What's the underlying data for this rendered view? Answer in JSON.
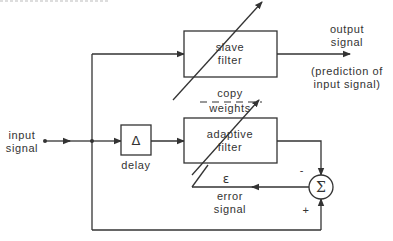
{
  "diagram": {
    "type": "adaptive-prediction-block-diagram",
    "blocks": {
      "slave_filter": {
        "line1": "slave",
        "line2": "filter"
      },
      "adaptive_filter": {
        "line1": "adaptive",
        "line2": "filter"
      },
      "delay": {
        "symbol": "Δ",
        "label": "delay"
      },
      "summer": {
        "symbol": "Σ",
        "minus": "-",
        "plus": "+"
      }
    },
    "labels": {
      "input_1": "input",
      "input_2": "signal",
      "output_1": "output",
      "output_2": "signal",
      "prediction_1": "(prediction  of",
      "prediction_2": "input  signal)",
      "copy_1": "copy",
      "copy_2": "weights",
      "error_symbol": "ε",
      "error_1": "error",
      "error_2": "signal"
    },
    "colors": {
      "stroke": "#333333",
      "background": "#ffffff"
    }
  }
}
